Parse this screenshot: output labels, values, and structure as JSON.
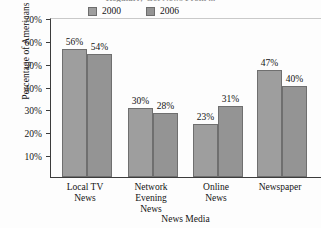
{
  "chart_data": {
    "type": "bar",
    "title": "Regularly Get News From ...",
    "xlabel": "News Media",
    "ylabel": "Percentage of Americans",
    "categories": [
      "Local TV News",
      "Network Evening News",
      "Online News",
      "Newspaper"
    ],
    "series": [
      {
        "name": "2000",
        "color": "#9e9e9e",
        "values": [
          56,
          54,
          30,
          28
        ]
      },
      {
        "name": "2006",
        "color": "#949494",
        "values": [
          54,
          28,
          31,
          40
        ]
      }
    ],
    "grouped_values": {
      "Local TV News": {
        "2000": 56,
        "2006": 54
      },
      "Network Evening News": {
        "2000": 30,
        "2006": 28
      },
      "Online News": {
        "2000": 23,
        "2006": 31
      },
      "Newspaper": {
        "2000": 47,
        "2006": 40
      }
    },
    "data_labels": [
      "56%",
      "54%",
      "30%",
      "28%",
      "23%",
      "31%",
      "47%",
      "40%"
    ],
    "ylim": [
      0,
      70
    ],
    "yticks": [
      10,
      20,
      30,
      40,
      50,
      60,
      70
    ],
    "ytick_labels": [
      "10%",
      "20%",
      "30%",
      "40%",
      "50%",
      "60%",
      "70%"
    ],
    "grid": false,
    "legend_position": "top-center"
  },
  "legend": {
    "entries": [
      {
        "label": "2000",
        "color": "#9e9e9e"
      },
      {
        "label": "2006",
        "color": "#949494"
      }
    ]
  },
  "axes": {
    "y_title": "Percentage of Americans",
    "x_title": "News Media"
  },
  "categories": [
    {
      "line1": "Local TV",
      "line2": "News",
      "line3": ""
    },
    {
      "line1": "Network",
      "line2": "Evening",
      "line3": "News"
    },
    {
      "line1": "Online",
      "line2": "News",
      "line3": ""
    },
    {
      "line1": "Newspaper",
      "line2": "",
      "line3": ""
    }
  ],
  "bars": [
    {
      "series": "2000",
      "category": "Local TV News",
      "value": 56,
      "label": "56%"
    },
    {
      "series": "2006",
      "category": "Local TV News",
      "value": 54,
      "label": "54%"
    },
    {
      "series": "2000",
      "category": "Network Evening News",
      "value": 30,
      "label": "30%"
    },
    {
      "series": "2006",
      "category": "Network Evening News",
      "value": 28,
      "label": "28%"
    },
    {
      "series": "2000",
      "category": "Online News",
      "value": 23,
      "label": "23%"
    },
    {
      "series": "2006",
      "category": "Online News",
      "value": 31,
      "label": "31%"
    },
    {
      "series": "2000",
      "category": "Newspaper",
      "value": 47,
      "label": "47%"
    },
    {
      "series": "2006",
      "category": "Newspaper",
      "value": 40,
      "label": "40%"
    }
  ],
  "yticks": [
    {
      "label": "70%",
      "value": 70
    },
    {
      "label": "60%",
      "value": 60
    },
    {
      "label": "50%",
      "value": 50
    },
    {
      "label": "40%",
      "value": 40
    },
    {
      "label": "30%",
      "value": 30
    },
    {
      "label": "20%",
      "value": 20
    },
    {
      "label": "10%",
      "value": 10
    }
  ]
}
